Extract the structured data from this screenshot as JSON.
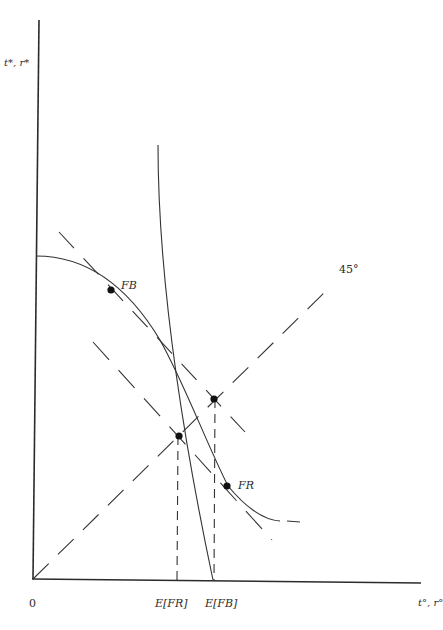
{
  "diagram": {
    "axes": {
      "y_label": "t*, r*",
      "x_label": "t°, r°",
      "origin_label": "0"
    },
    "x_ticks": [
      {
        "label": "E[FR]"
      },
      {
        "label": "E[FB]"
      }
    ],
    "points": [
      {
        "label": "FB"
      },
      {
        "label": "FR"
      }
    ],
    "line_labels": {
      "forty_five": "45°"
    },
    "colors": {
      "ink": "#2b2b2b",
      "background": "#ffffff"
    }
  }
}
